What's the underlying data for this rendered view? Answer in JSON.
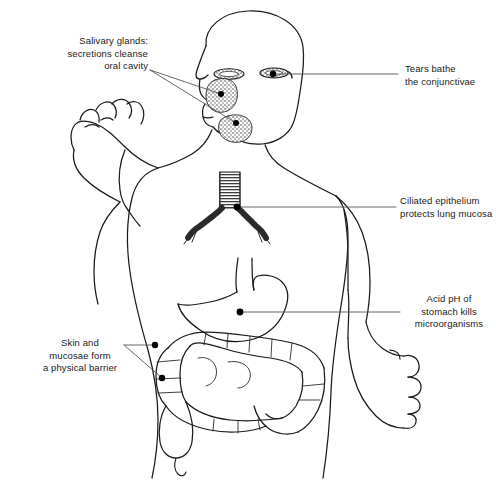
{
  "figure": {
    "type": "anatomical-line-diagram",
    "background_color": "#ffffff",
    "line_color": "#1a1a1a",
    "leader_color": "#555555",
    "marker_color": "#000000",
    "width": 496,
    "height": 496
  },
  "annotations": [
    {
      "id": "salivary-glands",
      "text": "Salivary glands:\nsecretions cleanse\noral cavity",
      "align": "right",
      "label_x": 30,
      "label_y": 35,
      "label_w": 118,
      "leader_from_x": 150,
      "leader_from_y": 70,
      "targets": [
        {
          "x": 221,
          "y": 94
        },
        {
          "x": 236,
          "y": 123
        }
      ],
      "organ": "parotid-and-submandibular-salivary-glands"
    },
    {
      "id": "tears",
      "text": "Tears bathe\nthe conjunctivae",
      "align": "left",
      "label_x": 405,
      "label_y": 63,
      "label_w": 90,
      "leader_from_x": 398,
      "leader_from_y": 74,
      "targets": [
        {
          "x": 273,
          "y": 74
        }
      ],
      "organ": "lacrimal-gland-eye"
    },
    {
      "id": "ciliated-epithelium",
      "text": "Ciliated epithelium\nprotects lung mucosa",
      "align": "left",
      "label_x": 400,
      "label_y": 195,
      "label_w": 96,
      "leader_from_x": 396,
      "leader_from_y": 207,
      "targets": [
        {
          "x": 237,
          "y": 207
        }
      ],
      "organ": "trachea-bronchi"
    },
    {
      "id": "stomach-acid",
      "text": "Acid pH of\nstomach kills\nmicroorganisms",
      "align": "left",
      "label_x": 404,
      "label_y": 293,
      "label_w": 90,
      "leader_from_x": 400,
      "leader_from_y": 312,
      "targets": [
        {
          "x": 240,
          "y": 312
        }
      ],
      "organ": "stomach"
    },
    {
      "id": "skin-barrier",
      "text": "Skin and\nmucosae form\na physical barrier",
      "align": "right",
      "label_x": 38,
      "label_y": 337,
      "label_w": 84,
      "leader_from_x": 124,
      "leader_from_y": 345,
      "targets": [
        {
          "x": 155,
          "y": 345
        },
        {
          "x": 162,
          "y": 378
        }
      ],
      "organ": "skin-and-mucosae"
    }
  ],
  "organs": [
    {
      "name": "head-face-profile",
      "interactable": false
    },
    {
      "name": "eye-left",
      "interactable": false
    },
    {
      "name": "eye-right",
      "interactable": false
    },
    {
      "name": "parotid-gland",
      "interactable": false
    },
    {
      "name": "submandibular-gland",
      "interactable": false
    },
    {
      "name": "neck-torso-outline",
      "interactable": false
    },
    {
      "name": "raised-arm-fist",
      "interactable": false
    },
    {
      "name": "lowered-arm-hand",
      "interactable": false
    },
    {
      "name": "trachea",
      "interactable": false
    },
    {
      "name": "bronchi",
      "interactable": false
    },
    {
      "name": "esophagus",
      "interactable": false
    },
    {
      "name": "stomach",
      "interactable": false
    },
    {
      "name": "large-intestine-colon",
      "interactable": false
    },
    {
      "name": "cecum-appendix",
      "interactable": false
    }
  ]
}
